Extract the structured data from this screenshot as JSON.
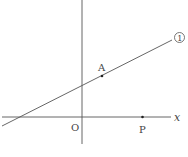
{
  "diagram": {
    "type": "coordinate-plane",
    "colors": {
      "stroke": "#555555",
      "text": "#444444",
      "background": "#ffffff"
    },
    "axes": {
      "x_label": "x",
      "origin_label": "O"
    },
    "line": {
      "label": "①",
      "description": "straight line with positive slope passing through point A"
    },
    "points": [
      {
        "name": "A",
        "label": "A",
        "description": "point on line ①"
      },
      {
        "name": "P",
        "label": "P",
        "description": "point on positive x-axis"
      }
    ]
  }
}
